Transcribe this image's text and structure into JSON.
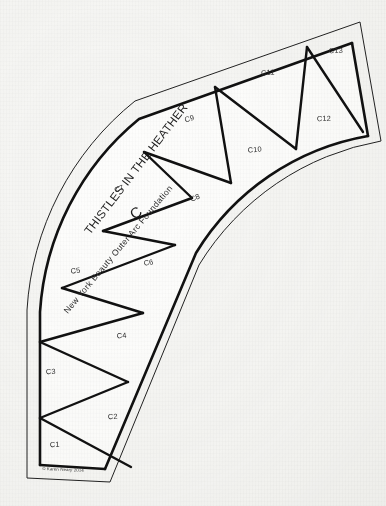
{
  "document": {
    "kind": "quilt-foundation-piecing-pattern",
    "title_curved": "THISTLES IN THE HEATHER",
    "subtitle_curved": "New York Beauty Outer Arc Foundation",
    "section_letter": "C",
    "copyright": "© Karen Neary 2014",
    "background_color": "#f6f6f4",
    "ink_color": "#111111",
    "paper_color": "#fdfdfc"
  },
  "pattern": {
    "shape": "quarter-arc-band",
    "piece_count": 13,
    "pieces": [
      {
        "id": "C1",
        "label": "C1",
        "x": 55,
        "y": 447
      },
      {
        "id": "C2",
        "label": "C2",
        "x": 113,
        "y": 419
      },
      {
        "id": "C3",
        "label": "C3",
        "x": 51,
        "y": 374
      },
      {
        "id": "C4",
        "label": "C4",
        "x": 122,
        "y": 338
      },
      {
        "id": "C5",
        "label": "C5",
        "x": 76,
        "y": 273
      },
      {
        "id": "C6",
        "label": "C6",
        "x": 149,
        "y": 265
      },
      {
        "id": "C7",
        "label": "C7",
        "x": 120,
        "y": 191
      },
      {
        "id": "C8",
        "label": "C8",
        "x": 196,
        "y": 200
      },
      {
        "id": "C9",
        "label": "C9",
        "x": 190,
        "y": 121
      },
      {
        "id": "C10",
        "label": "C10",
        "x": 255,
        "y": 152
      },
      {
        "id": "C11",
        "label": "C11",
        "x": 268,
        "y": 75
      },
      {
        "id": "C12",
        "label": "C12",
        "x": 324,
        "y": 121
      },
      {
        "id": "C13",
        "label": "C13",
        "x": 336,
        "y": 53
      }
    ]
  }
}
